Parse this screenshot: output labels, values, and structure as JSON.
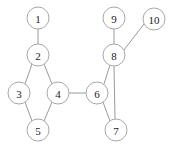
{
  "figure": {
    "kind": "undirected-graph-diagram",
    "width": 173,
    "height": 150,
    "background_color": "#ffffff"
  },
  "style": {
    "node_fill": "#ffffff",
    "node_stroke": "#a8a8a8",
    "node_radius": 11,
    "node_stroke_width": 1,
    "label_color": "#1a1a1a",
    "label_font_size": 11,
    "edge_color": "#9a9a9a",
    "edge_width": 1
  },
  "graph": {
    "node_count": 10,
    "edge_count": 11,
    "nodes": [
      {
        "id": "1",
        "label": "1",
        "cx": 38,
        "cy": 18
      },
      {
        "id": "2",
        "label": "2",
        "cx": 38,
        "cy": 55
      },
      {
        "id": "3",
        "label": "3",
        "cx": 19,
        "cy": 93
      },
      {
        "id": "4",
        "label": "4",
        "cx": 58,
        "cy": 93
      },
      {
        "id": "5",
        "label": "5",
        "cx": 38,
        "cy": 130
      },
      {
        "id": "6",
        "label": "6",
        "cx": 97,
        "cy": 93
      },
      {
        "id": "7",
        "label": "7",
        "cx": 116,
        "cy": 130
      },
      {
        "id": "8",
        "label": "8",
        "cx": 114,
        "cy": 55
      },
      {
        "id": "9",
        "label": "9",
        "cx": 114,
        "cy": 18
      },
      {
        "id": "10",
        "label": "10",
        "cx": 154,
        "cy": 19
      }
    ],
    "edges": [
      {
        "source": "1",
        "target": "2",
        "x1": 38,
        "y1": 29,
        "x2": 38,
        "y2": 44
      },
      {
        "source": "2",
        "target": "3",
        "x1": 32,
        "y1": 64,
        "x2": 25,
        "y2": 84
      },
      {
        "source": "2",
        "target": "4",
        "x1": 44,
        "y1": 64,
        "x2": 52,
        "y2": 84
      },
      {
        "source": "3",
        "target": "5",
        "x1": 25,
        "y1": 102,
        "x2": 32,
        "y2": 121
      },
      {
        "source": "4",
        "target": "5",
        "x1": 52,
        "y1": 102,
        "x2": 44,
        "y2": 121
      },
      {
        "source": "4",
        "target": "6",
        "x1": 69,
        "y1": 93,
        "x2": 86,
        "y2": 93
      },
      {
        "source": "6",
        "target": "7",
        "x1": 103,
        "y1": 102,
        "x2": 110,
        "y2": 121
      },
      {
        "source": "6",
        "target": "8",
        "x1": 104,
        "y1": 84,
        "x2": 110,
        "y2": 65
      },
      {
        "source": "7",
        "target": "8",
        "x1": 115,
        "y1": 119,
        "x2": 114,
        "y2": 66
      },
      {
        "source": "8",
        "target": "9",
        "x1": 114,
        "y1": 44,
        "x2": 114,
        "y2": 29
      },
      {
        "source": "8",
        "target": "10",
        "x1": 124,
        "y1": 50,
        "x2": 144,
        "y2": 24
      }
    ]
  }
}
